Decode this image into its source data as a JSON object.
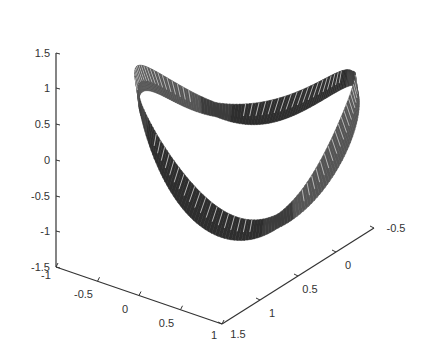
{
  "chart_data": {
    "type": "surface3d",
    "title": "",
    "xlabel": "",
    "ylabel": "",
    "zlabel": "",
    "x_axis": {
      "ticks": [
        "-1",
        "-0.5",
        "0",
        "0.5",
        "1"
      ],
      "range": [
        -1,
        1
      ]
    },
    "y_axis": {
      "ticks": [
        "1.5",
        "1",
        "0.5",
        "0",
        "-0.5"
      ],
      "range": [
        -0.5,
        1.5
      ]
    },
    "z_axis": {
      "ticks": [
        "1.5",
        "1",
        "0.5",
        "0",
        "-0.5",
        "-1",
        "-1.5"
      ],
      "range": [
        -1.5,
        1.5
      ]
    },
    "grid": false,
    "legend": null,
    "colormap": "gray",
    "surface_color": "#3a3a3a",
    "mesh_color": "#888888"
  },
  "axes": {
    "z_ticks": [
      {
        "label": "1.5",
        "y": 53
      },
      {
        "label": "1",
        "y": 88
      },
      {
        "label": "0.5",
        "y": 124
      },
      {
        "label": "0",
        "y": 160
      },
      {
        "label": "-0.5",
        "y": 196
      },
      {
        "label": "-1",
        "y": 231
      },
      {
        "label": "-1.5",
        "y": 267
      }
    ],
    "x_ticks": [
      {
        "label": "-1",
        "t": 0
      },
      {
        "label": "-0.5",
        "t": 0.25
      },
      {
        "label": "0",
        "t": 0.5
      },
      {
        "label": "0.5",
        "t": 0.75
      },
      {
        "label": "1",
        "t": 1
      }
    ],
    "y_ticks": [
      {
        "label": "1.5",
        "t": 0
      },
      {
        "label": "1",
        "t": 0.25
      },
      {
        "label": "0.5",
        "t": 0.5
      },
      {
        "label": "0",
        "t": 0.75
      },
      {
        "label": "-0.5",
        "t": 1
      }
    ]
  }
}
